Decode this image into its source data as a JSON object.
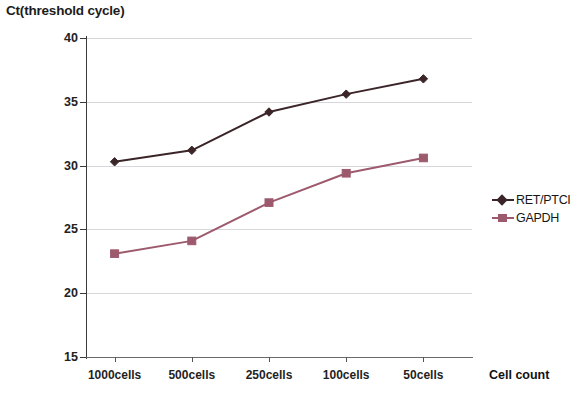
{
  "chart_data": {
    "type": "line",
    "title": "Ct(threshold cycle)",
    "xlabel": "Cell count",
    "ylabel": "",
    "categories": [
      "1000cells",
      "500cells",
      "250cells",
      "100cells",
      "50cells"
    ],
    "ylim": [
      15,
      40
    ],
    "yticks": [
      15,
      20,
      25,
      30,
      35,
      40
    ],
    "grid": true,
    "legend_position": "right",
    "series": [
      {
        "name": "RET/PTCI",
        "color": "#3b2528",
        "marker": "diamond",
        "values": [
          30.3,
          31.2,
          34.2,
          35.6,
          36.8
        ]
      },
      {
        "name": "GAPDH",
        "color": "#9d5a6d",
        "marker": "square",
        "values": [
          23.1,
          24.1,
          27.1,
          29.4,
          30.6
        ]
      }
    ]
  }
}
